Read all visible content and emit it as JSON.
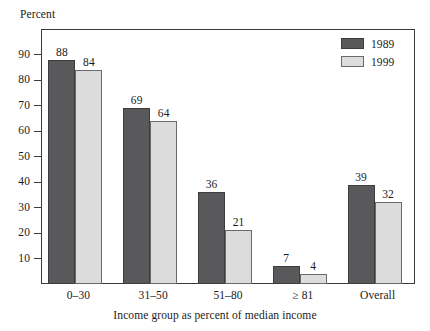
{
  "chart_data": {
    "type": "bar",
    "title": "",
    "xlabel": "Income group as percent of median income",
    "ylabel": "Percent",
    "categories": [
      "0–30",
      "31–50",
      "51–80",
      "≥ 81",
      "Overall"
    ],
    "series": [
      {
        "name": "1989",
        "color": "#59595b",
        "values": [
          88,
          69,
          36,
          7,
          39
        ]
      },
      {
        "name": "1999",
        "color": "#dcdcdc",
        "values": [
          84,
          64,
          21,
          4,
          32
        ]
      }
    ],
    "ylim": [
      0,
      100
    ],
    "ytick_values": [
      10,
      20,
      30,
      40,
      50,
      60,
      70,
      80,
      90
    ],
    "ytick_labels": [
      "10",
      "20",
      "30",
      "40",
      "50",
      "60",
      "70",
      "80",
      "90"
    ],
    "grid": false,
    "legend_position": "top-right",
    "value_labels_shown": true
  },
  "legend": {
    "entries": [
      {
        "label": "1989",
        "swatch": "dark-gray-swatch"
      },
      {
        "label": "1999",
        "swatch": "light-gray-swatch"
      }
    ]
  },
  "axes": {
    "y_caption": "Percent",
    "x_caption": "Income group as percent of median income"
  }
}
